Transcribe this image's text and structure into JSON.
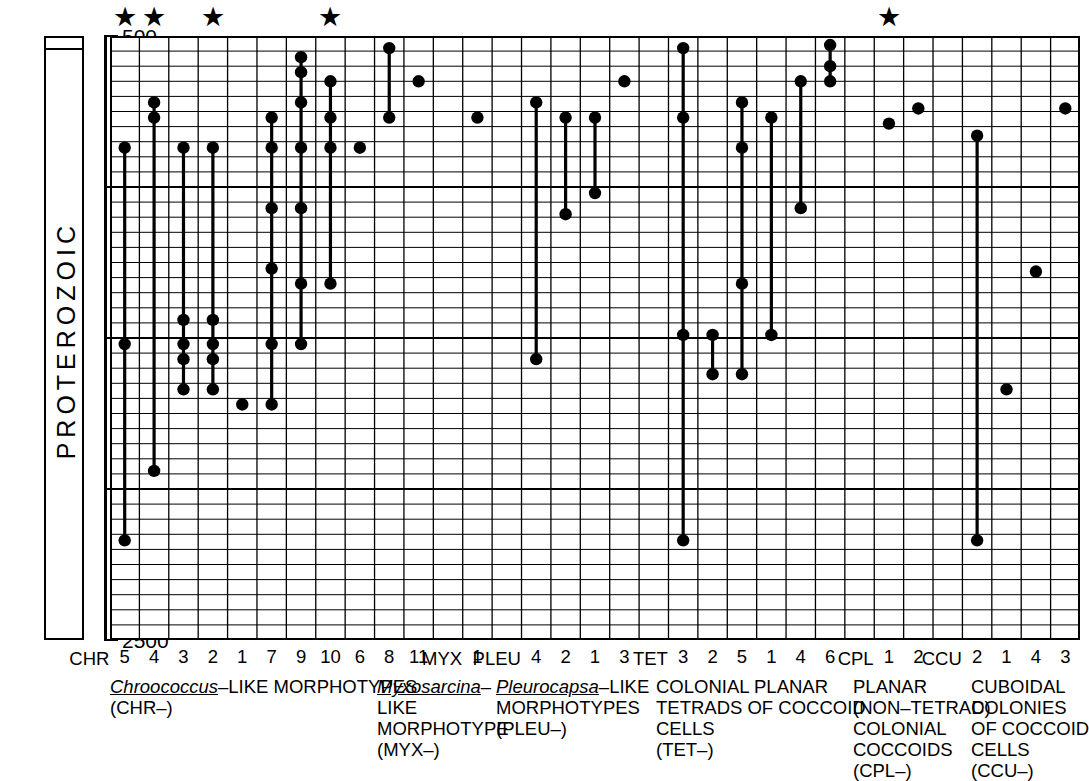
{
  "chart_data": {
    "type": "scatter",
    "title": "",
    "xlabel": "",
    "ylabel": "PROTEROZOIC",
    "ylim": [
      500,
      2500
    ],
    "yticks": [
      500,
      1000,
      1500,
      2000,
      2500
    ],
    "ytick_labels": [
      "500",
      "1000",
      "1500",
      "2000",
      "2500"
    ],
    "y_axis_units": "Ma",
    "y_inverted": true,
    "grid": true,
    "grid_minor_y_step": 50,
    "legend": "none",
    "columns": [
      "CHR 5",
      "CHR 4",
      "CHR 3",
      "CHR 2",
      "CHR 1",
      "CHR 7",
      "CHR 9",
      "CHR 10",
      "CHR 6",
      "CHR 8",
      "CHR 11",
      "",
      "MYX 1",
      "",
      "PLEU 4",
      "PLEU 2",
      "PLEU 1",
      "PLEU 3",
      "",
      "TET 3",
      "TET 2",
      "TET 5",
      "TET 1",
      "TET 4",
      "TET 6",
      "",
      "CPL 1",
      "CPL 2",
      "",
      "CCU 2",
      "CCU 1",
      "CCU 4",
      "CCU 3"
    ],
    "column_tick_labels": [
      "5",
      "4",
      "3",
      "2",
      "1",
      "7",
      "9",
      "10",
      "6",
      "8",
      "11",
      "",
      "1",
      "",
      "4",
      "2",
      "1",
      "3",
      "",
      "3",
      "2",
      "5",
      "1",
      "4",
      "6",
      "",
      "1",
      "2",
      "",
      "2",
      "1",
      "4",
      "3"
    ],
    "series": [
      {
        "column": "CHR 5",
        "col_index": 0,
        "points": [
          870,
          1520,
          2170
        ],
        "range": [
          870,
          2170
        ]
      },
      {
        "column": "CHR 4",
        "col_index": 1,
        "points": [
          720,
          770,
          1940
        ],
        "range": [
          720,
          1940
        ]
      },
      {
        "column": "CHR 3",
        "col_index": 2,
        "points": [
          870,
          1440,
          1520,
          1570,
          1670
        ],
        "range": [
          870,
          1670
        ]
      },
      {
        "column": "CHR 2",
        "col_index": 3,
        "points": [
          870,
          1440,
          1520,
          1570,
          1670
        ],
        "range": [
          870,
          1670
        ]
      },
      {
        "column": "CHR 1",
        "col_index": 4,
        "points": [
          1720
        ],
        "range": null
      },
      {
        "column": "CHR 7",
        "col_index": 5,
        "points": [
          770,
          870,
          1070,
          1270,
          1520,
          1720
        ],
        "range": [
          770,
          1720
        ]
      },
      {
        "column": "CHR 9",
        "col_index": 6,
        "points": [
          570,
          620,
          720,
          870,
          1070,
          1320,
          1520
        ],
        "range": [
          570,
          1520
        ]
      },
      {
        "column": "CHR 10",
        "col_index": 7,
        "points": [
          650,
          770,
          870,
          1320
        ],
        "range": [
          650,
          1320
        ]
      },
      {
        "column": "CHR 6",
        "col_index": 8,
        "points": [
          870
        ],
        "range": null
      },
      {
        "column": "CHR 8",
        "col_index": 9,
        "points": [
          540,
          770
        ],
        "range": [
          540,
          770
        ]
      },
      {
        "column": "CHR 11",
        "col_index": 10,
        "points": [
          650
        ],
        "range": null
      },
      {
        "column": "MYX 1",
        "col_index": 12,
        "points": [
          770
        ],
        "range": null
      },
      {
        "column": "PLEU 4",
        "col_index": 14,
        "points": [
          720,
          1570
        ],
        "range": [
          720,
          1570
        ]
      },
      {
        "column": "PLEU 2",
        "col_index": 15,
        "points": [
          770,
          1090
        ],
        "range": [
          770,
          1090
        ]
      },
      {
        "column": "PLEU 1",
        "col_index": 16,
        "points": [
          770,
          1020
        ],
        "range": [
          770,
          1020
        ]
      },
      {
        "column": "PLEU 3",
        "col_index": 17,
        "points": [
          650
        ],
        "range": null
      },
      {
        "column": "TET 3",
        "col_index": 19,
        "points": [
          540,
          770,
          1490,
          2170
        ],
        "range": [
          540,
          2170
        ]
      },
      {
        "column": "TET 2",
        "col_index": 20,
        "points": [
          1490,
          1620
        ],
        "range": [
          1490,
          1620
        ]
      },
      {
        "column": "TET 5",
        "col_index": 21,
        "points": [
          720,
          870,
          1320,
          1620
        ],
        "range": [
          720,
          1620
        ]
      },
      {
        "column": "TET 1",
        "col_index": 22,
        "points": [
          770,
          1490
        ],
        "range": [
          770,
          1490
        ]
      },
      {
        "column": "TET 4",
        "col_index": 23,
        "points": [
          650,
          1070
        ],
        "range": [
          650,
          1070
        ]
      },
      {
        "column": "TET 6",
        "col_index": 24,
        "points": [
          530,
          600,
          650
        ],
        "range": [
          530,
          650
        ]
      },
      {
        "column": "CPL 1",
        "col_index": 26,
        "points": [
          790
        ],
        "range": null
      },
      {
        "column": "CPL 2",
        "col_index": 27,
        "points": [
          740
        ],
        "range": null
      },
      {
        "column": "CCU 2",
        "col_index": 29,
        "points": [
          830,
          2170
        ],
        "range": [
          830,
          2170
        ]
      },
      {
        "column": "CCU 1",
        "col_index": 30,
        "points": [
          1670
        ],
        "range": null
      },
      {
        "column": "CCU 4",
        "col_index": 31,
        "points": [
          1280
        ],
        "range": null
      },
      {
        "column": "CCU 3",
        "col_index": 32,
        "points": [
          740
        ],
        "range": null
      }
    ],
    "starred_columns": [
      "CHR 5",
      "CHR 4",
      "CHR 2",
      "CHR 10",
      "CPL 1"
    ],
    "star_marker": "★",
    "marker_color": "#000000",
    "grid_color": "#000000"
  },
  "axis": {
    "era_name": "PROTEROZOIC",
    "tick_labels": [
      "500",
      "1000",
      "1500",
      "2000",
      "2500"
    ]
  },
  "groups": [
    {
      "id": "chr",
      "prefix": "CHR",
      "prefix_col_index": 0,
      "name_italic": "Chroococcus",
      "name_rest": "–LIKE MORPHOTYPES",
      "lines": [
        "(CHR–)"
      ],
      "left_px": 110
    },
    {
      "id": "myx",
      "prefix": "MYX",
      "prefix_col_index": 12,
      "name_italic": "Myxosarcina",
      "name_rest": "–",
      "lines": [
        "LIKE",
        "MORPHOTYPE",
        "(MYX–)"
      ],
      "left_px": 377
    },
    {
      "id": "pleu",
      "prefix": "PLEU",
      "prefix_col_index": 14,
      "name_italic": "Pleurocapsa",
      "name_rest": "–LIKE",
      "lines": [
        "MORPHOTYPES",
        "(PLEU–)"
      ],
      "left_px": 496
    },
    {
      "id": "tet",
      "prefix": "TET",
      "prefix_col_index": 19,
      "name_italic": "",
      "name_rest": "COLONIAL PLANAR",
      "lines": [
        "TETRADS OF COCCOID",
        "CELLS",
        "(TET–)"
      ],
      "left_px": 656
    },
    {
      "id": "cpl",
      "prefix": "CPL",
      "prefix_col_index": 26,
      "name_italic": "",
      "name_rest": "PLANAR",
      "lines": [
        "(NON–TETRAD)",
        "COLONIAL",
        "COCCOIDS",
        "(CPL–)"
      ],
      "left_px": 853
    },
    {
      "id": "ccu",
      "prefix": "CCU",
      "prefix_col_index": 29,
      "name_italic": "",
      "name_rest": "CUBOIDAL",
      "lines": [
        "COLONIES",
        "OF COCCOID",
        "CELLS",
        "(CCU–)"
      ],
      "left_px": 971
    }
  ]
}
